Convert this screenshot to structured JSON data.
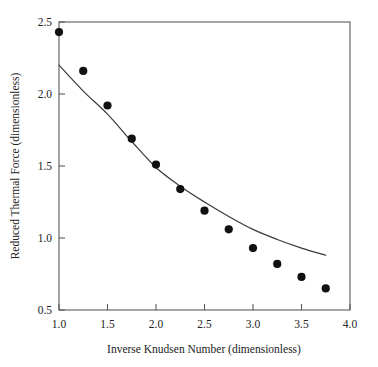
{
  "chart_data": {
    "type": "scatter",
    "title": "",
    "xlabel": "Inverse Knudsen Number (dimensionless)",
    "ylabel": "Reduced Thermal Force (dimensionless)",
    "xlim": [
      1.0,
      4.0
    ],
    "ylim": [
      0.5,
      2.5
    ],
    "grid": false,
    "legend": null,
    "xticks": [
      1.0,
      1.5,
      2.0,
      2.5,
      3.0,
      3.5,
      4.0
    ],
    "xtick_labels": [
      "1.0",
      "1.5",
      "2.0",
      "2.5",
      "3.0",
      "3.5",
      "4.0"
    ],
    "yticks": [
      0.5,
      1.0,
      1.5,
      2.0,
      2.5
    ],
    "ytick_labels": [
      "0.5",
      "1.0",
      "1.5",
      "2.0",
      "2.5"
    ],
    "series": [
      {
        "name": "measured-data",
        "type": "scatter",
        "marker": "filled-circle",
        "color": "#111111",
        "x": [
          1.0,
          1.25,
          1.5,
          1.75,
          2.0,
          2.25,
          2.5,
          2.75,
          3.0,
          3.25,
          3.5,
          3.75
        ],
        "y": [
          2.43,
          2.16,
          1.92,
          1.69,
          1.51,
          1.34,
          1.19,
          1.06,
          0.93,
          0.82,
          0.73,
          0.65
        ]
      },
      {
        "name": "theory-curve",
        "type": "line",
        "color": "#3a3a3a",
        "x": [
          1.0,
          1.25,
          1.5,
          1.75,
          2.0,
          2.25,
          2.5,
          2.75,
          3.0,
          3.25,
          3.5,
          3.75
        ],
        "y": [
          2.2,
          2.02,
          1.86,
          1.67,
          1.49,
          1.36,
          1.25,
          1.15,
          1.06,
          0.99,
          0.93,
          0.88
        ]
      }
    ]
  },
  "axes": {
    "x_title": "Inverse Knudsen Number (dimensionless)",
    "y_title": "Reduced Thermal Force (dimensionless)",
    "x_tick_labels": [
      "1.0",
      "1.5",
      "2.0",
      "2.5",
      "3.0",
      "3.5",
      "4.0"
    ],
    "y_tick_labels": [
      "2.5",
      "2.0",
      "1.5",
      "1.0",
      "0.5"
    ]
  },
  "colors": {
    "marker": "#111111",
    "curve": "#3a3a3a",
    "frame": "#5a5a5a",
    "text": "#222222",
    "background": "#ffffff"
  }
}
